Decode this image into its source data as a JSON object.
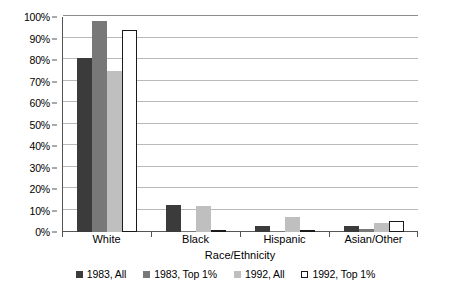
{
  "chart_data": {
    "type": "bar",
    "title": "",
    "xlabel": "Race/Ethnicity",
    "ylabel": "",
    "categories": [
      "White",
      "Black",
      "Hispanic",
      "Asian/Other"
    ],
    "series": [
      {
        "name": "1983, All",
        "color": "#3b3b3b",
        "values": [
          81,
          12.5,
          3,
          3
        ]
      },
      {
        "name": "1983, Top 1%",
        "color": "#787878",
        "values": [
          98,
          0.5,
          0.3,
          1.5
        ]
      },
      {
        "name": "1992, All",
        "color": "#bfbfbf",
        "values": [
          75,
          12,
          7,
          4
        ]
      },
      {
        "name": "1992, Top 1%",
        "color": "#ffffff",
        "values": [
          94,
          0.5,
          1,
          5
        ]
      }
    ],
    "ylim": [
      0,
      100
    ],
    "y_ticks": [
      0,
      10,
      20,
      30,
      40,
      50,
      60,
      70,
      80,
      90,
      100
    ],
    "y_tick_labels": [
      "0%",
      "10%",
      "20%",
      "30%",
      "40%",
      "50%",
      "60%",
      "70%",
      "80%",
      "90%",
      "100%"
    ],
    "grid": true,
    "grid_axis": "y",
    "legend_position": "bottom"
  },
  "legend": {
    "items": [
      {
        "label": "1983, All"
      },
      {
        "label": "1983, Top 1%"
      },
      {
        "label": "1992, All"
      },
      {
        "label": "1992, Top 1%"
      }
    ]
  }
}
